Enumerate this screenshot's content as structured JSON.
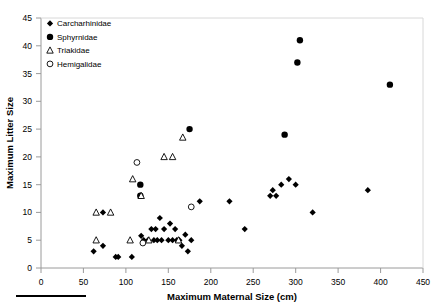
{
  "chart_data": {
    "type": "scatter",
    "title": "",
    "xlabel": "Maximum Maternal Size (cm)",
    "ylabel": "Maximum Litter Size",
    "xlim": [
      0,
      450
    ],
    "ylim": [
      0,
      45
    ],
    "xticks": [
      0,
      50,
      100,
      150,
      200,
      250,
      300,
      350,
      400,
      450
    ],
    "yticks": [
      0,
      5,
      10,
      15,
      20,
      25,
      30,
      35,
      40,
      45
    ],
    "grid": false,
    "legend_position": "top-left",
    "series": [
      {
        "name": "Carcharhinidae",
        "marker": "filled-diamond",
        "color": "#000000",
        "points": [
          [
            62,
            3
          ],
          [
            73,
            10
          ],
          [
            73,
            4
          ],
          [
            88,
            2
          ],
          [
            91,
            2
          ],
          [
            107,
            2
          ],
          [
            118,
            5.8
          ],
          [
            121,
            5
          ],
          [
            126,
            5
          ],
          [
            130,
            7
          ],
          [
            133,
            5
          ],
          [
            135,
            7
          ],
          [
            137,
            5
          ],
          [
            140,
            9
          ],
          [
            142,
            5
          ],
          [
            145,
            7
          ],
          [
            150,
            5
          ],
          [
            152,
            8
          ],
          [
            155,
            5
          ],
          [
            158,
            7
          ],
          [
            160,
            5
          ],
          [
            162,
            5
          ],
          [
            163,
            5
          ],
          [
            166,
            4
          ],
          [
            170,
            6
          ],
          [
            173,
            3
          ],
          [
            177,
            5
          ],
          [
            187,
            12
          ],
          [
            222,
            12
          ],
          [
            240,
            7
          ],
          [
            270,
            13
          ],
          [
            273,
            14
          ],
          [
            277,
            13
          ],
          [
            283,
            15
          ],
          [
            292,
            16
          ],
          [
            300,
            15
          ],
          [
            320,
            10
          ],
          [
            385,
            14
          ]
        ]
      },
      {
        "name": "Sphyrnidae",
        "marker": "filled-circle",
        "color": "#000000",
        "points": [
          [
            117,
            15
          ],
          [
            117,
            13
          ],
          [
            175,
            25
          ],
          [
            287,
            24
          ],
          [
            302,
            37
          ],
          [
            305,
            41
          ],
          [
            411,
            33
          ]
        ]
      },
      {
        "name": "Triakidae",
        "marker": "open-triangle",
        "color": "#000000",
        "points": [
          [
            65,
            10
          ],
          [
            82,
            10
          ],
          [
            65,
            5
          ],
          [
            108,
            16
          ],
          [
            105,
            5
          ],
          [
            118,
            13
          ],
          [
            127,
            5
          ],
          [
            145,
            20
          ],
          [
            155,
            20
          ],
          [
            162,
            5
          ],
          [
            167,
            23.5
          ]
        ]
      },
      {
        "name": "Hemigalidae",
        "marker": "open-circle",
        "color": "#000000",
        "points": [
          [
            113,
            19
          ],
          [
            120,
            4.5
          ],
          [
            177,
            11
          ]
        ]
      }
    ]
  },
  "legend": {
    "items": [
      {
        "label": "Carcharhinidae",
        "marker": "filled-diamond"
      },
      {
        "label": "Sphyrnidae",
        "marker": "filled-circle"
      },
      {
        "label": "Triakidae",
        "marker": "open-triangle"
      },
      {
        "label": "Hemigalidae",
        "marker": "open-circle"
      }
    ]
  },
  "axes": {
    "x_title": "Maximum Maternal Size (cm)",
    "y_title": "Maximum Litter Size",
    "x_tick_labels": [
      "0",
      "50",
      "100",
      "150",
      "200",
      "250",
      "300",
      "350",
      "400",
      "450"
    ],
    "y_tick_labels": [
      "0",
      "5",
      "10",
      "15",
      "20",
      "25",
      "30",
      "35",
      "40",
      "45"
    ]
  },
  "footer": {
    "rule": ""
  },
  "colors": {
    "marker": "#000000",
    "axis": "#808080",
    "background": "#ffffff"
  }
}
